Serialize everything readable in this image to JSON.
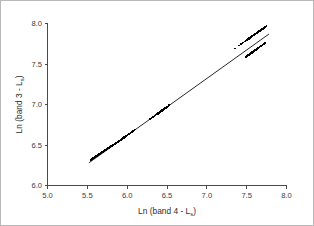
{
  "figure": {
    "background_color": "#ffffff",
    "border_color": "#b9b9b9",
    "width": 314,
    "height": 226
  },
  "chart_data": {
    "type": "scatter",
    "title": "",
    "subtitle": "",
    "xlabel_prefix": "Ln (band 4 - L",
    "xlabel_sub": "s",
    "xlabel_suffix": ")",
    "ylabel_prefix": "Ln (band 3 - L",
    "ylabel_sub": "s",
    "ylabel_suffix": ")",
    "xlabel": "Ln (band 4 - Ls)",
    "ylabel": "Ln (band 3 - Ls)",
    "xlim": [
      5.0,
      8.0
    ],
    "ylim": [
      6.0,
      8.0
    ],
    "xticks": [
      5.0,
      5.5,
      6.0,
      6.5,
      7.0,
      7.5,
      8.0
    ],
    "xticklabels": [
      "5.0",
      "5.5",
      "6.0",
      "6.5",
      "7.0",
      "7.5",
      "8.0"
    ],
    "yticks": [
      6.0,
      6.5,
      7.0,
      7.5,
      8.0
    ],
    "yticklabels": [
      "6.0",
      "6.5",
      "7.0",
      "7.5",
      "8.0"
    ],
    "grid": false,
    "legend": null,
    "marker": "square",
    "marker_color": "#000000",
    "marker_size_px": 1.7,
    "line_color": "#000000",
    "fit_line": {
      "x_start": 5.52,
      "y_start": 6.28,
      "x_end": 7.78,
      "y_end": 7.87,
      "slope": 0.7035,
      "intercept": 2.3976
    },
    "x": [
      5.545,
      5.552,
      5.561,
      5.566,
      5.572,
      5.575,
      5.58,
      5.583,
      5.588,
      5.592,
      5.596,
      5.6,
      5.603,
      5.607,
      5.61,
      5.614,
      5.617,
      5.62,
      5.624,
      5.627,
      5.63,
      5.634,
      5.637,
      5.64,
      5.644,
      5.647,
      5.651,
      5.654,
      5.658,
      5.661,
      5.665,
      5.668,
      5.672,
      5.675,
      5.679,
      5.682,
      5.686,
      5.689,
      5.693,
      5.696,
      5.7,
      5.703,
      5.707,
      5.71,
      5.714,
      5.717,
      5.721,
      5.724,
      5.728,
      5.731,
      5.735,
      5.738,
      5.742,
      5.745,
      5.749,
      5.752,
      5.756,
      5.759,
      5.763,
      5.766,
      5.77,
      5.773,
      5.777,
      5.78,
      5.784,
      5.787,
      5.791,
      5.794,
      5.798,
      5.801,
      5.805,
      5.808,
      5.812,
      5.815,
      5.819,
      5.822,
      5.826,
      5.829,
      5.833,
      5.836,
      5.84,
      5.843,
      5.847,
      5.85,
      5.854,
      5.858,
      5.862,
      5.866,
      5.87,
      5.874,
      5.878,
      5.882,
      5.886,
      5.89,
      5.894,
      5.898,
      5.902,
      5.906,
      5.91,
      5.915,
      5.92,
      5.925,
      5.93,
      5.935,
      5.94,
      5.946,
      5.952,
      5.958,
      5.964,
      5.97,
      5.977,
      5.984,
      5.991,
      5.998,
      6.006,
      6.014,
      6.022,
      6.031,
      6.04,
      6.05,
      6.06,
      6.072,
      6.085,
      6.1,
      6.29,
      6.305,
      6.32,
      6.332,
      6.344,
      6.355,
      6.365,
      6.374,
      6.383,
      6.391,
      6.399,
      6.406,
      6.413,
      6.42,
      6.427,
      6.434,
      6.441,
      6.448,
      6.455,
      6.462,
      6.469,
      6.476,
      6.484,
      6.492,
      6.5,
      6.509,
      6.518,
      6.528,
      7.355,
      7.405,
      7.43,
      7.448,
      7.462,
      7.474,
      7.484,
      7.493,
      7.501,
      7.508,
      7.515,
      7.521,
      7.527,
      7.533,
      7.538,
      7.543,
      7.548,
      7.553,
      7.558,
      7.562,
      7.567,
      7.571,
      7.575,
      7.579,
      7.583,
      7.587,
      7.591,
      7.595,
      7.599,
      7.603,
      7.607,
      7.611,
      7.615,
      7.619,
      7.623,
      7.627,
      7.631,
      7.635,
      7.639,
      7.643,
      7.647,
      7.651,
      7.655,
      7.659,
      7.663,
      7.667,
      7.671,
      7.675,
      7.679,
      7.683,
      7.687,
      7.691,
      7.695,
      7.699,
      7.703,
      7.707,
      7.711,
      7.715,
      7.72,
      7.725,
      7.73,
      7.736,
      7.742,
      7.748,
      7.49,
      7.5,
      7.51,
      7.519,
      7.527,
      7.535,
      7.543,
      7.55,
      7.557,
      7.564,
      7.571,
      7.578,
      7.585,
      7.592,
      7.599,
      7.606,
      7.613,
      7.62,
      7.627,
      7.634,
      7.641,
      7.648,
      7.655,
      7.662,
      7.669,
      7.676,
      7.683,
      7.69,
      7.697,
      7.704,
      7.711,
      7.718,
      7.725,
      7.732
    ],
    "y": [
      6.318,
      6.323,
      6.329,
      6.332,
      6.336,
      6.338,
      6.341,
      6.343,
      6.347,
      6.35,
      6.352,
      6.355,
      6.357,
      6.36,
      6.362,
      6.364,
      6.366,
      6.368,
      6.371,
      6.373,
      6.375,
      6.377,
      6.379,
      6.381,
      6.384,
      6.386,
      6.388,
      6.39,
      6.393,
      6.395,
      6.397,
      6.399,
      6.402,
      6.404,
      6.406,
      6.408,
      6.411,
      6.413,
      6.415,
      6.417,
      6.42,
      6.422,
      6.424,
      6.426,
      6.429,
      6.431,
      6.433,
      6.435,
      6.438,
      6.44,
      6.442,
      6.444,
      6.447,
      6.449,
      6.451,
      6.453,
      6.456,
      6.458,
      6.46,
      6.462,
      6.465,
      6.467,
      6.469,
      6.471,
      6.474,
      6.476,
      6.478,
      6.48,
      6.483,
      6.485,
      6.487,
      6.489,
      6.492,
      6.494,
      6.496,
      6.498,
      6.501,
      6.503,
      6.505,
      6.507,
      6.51,
      6.512,
      6.514,
      6.516,
      6.519,
      6.522,
      6.524,
      6.527,
      6.53,
      6.532,
      6.535,
      6.538,
      6.54,
      6.543,
      6.546,
      6.549,
      6.551,
      6.554,
      6.557,
      6.56,
      6.564,
      6.567,
      6.571,
      6.574,
      6.578,
      6.582,
      6.586,
      6.59,
      6.595,
      6.599,
      6.604,
      6.609,
      6.614,
      6.619,
      6.624,
      6.63,
      6.636,
      6.642,
      6.648,
      6.655,
      6.662,
      6.67,
      6.679,
      6.69,
      6.822,
      6.833,
      6.843,
      6.852,
      6.86,
      6.868,
      6.875,
      6.881,
      6.887,
      6.893,
      6.899,
      6.904,
      6.909,
      6.914,
      6.919,
      6.924,
      6.929,
      6.934,
      6.939,
      6.944,
      6.949,
      6.954,
      6.959,
      6.965,
      6.971,
      6.977,
      6.983,
      6.99,
      7.692,
      7.727,
      7.745,
      7.757,
      7.767,
      7.776,
      7.783,
      7.789,
      7.795,
      7.8,
      7.805,
      7.809,
      7.813,
      7.817,
      7.821,
      7.825,
      7.828,
      7.832,
      7.835,
      7.838,
      7.842,
      7.845,
      7.848,
      7.851,
      7.853,
      7.856,
      7.859,
      7.862,
      7.865,
      7.867,
      7.87,
      7.873,
      7.876,
      7.878,
      7.881,
      7.884,
      7.887,
      7.889,
      7.892,
      7.895,
      7.898,
      7.9,
      7.903,
      7.906,
      7.909,
      7.911,
      7.914,
      7.917,
      7.92,
      7.922,
      7.925,
      7.928,
      7.931,
      7.934,
      7.936,
      7.939,
      7.942,
      7.945,
      7.948,
      7.952,
      7.956,
      7.96,
      7.964,
      7.968,
      7.588,
      7.595,
      7.602,
      7.608,
      7.614,
      7.62,
      7.625,
      7.63,
      7.635,
      7.64,
      7.645,
      7.65,
      7.655,
      7.66,
      7.665,
      7.67,
      7.675,
      7.68,
      7.685,
      7.69,
      7.695,
      7.7,
      7.705,
      7.71,
      7.715,
      7.72,
      7.725,
      7.73,
      7.735,
      7.74,
      7.745,
      7.75,
      7.755,
      7.76
    ]
  }
}
